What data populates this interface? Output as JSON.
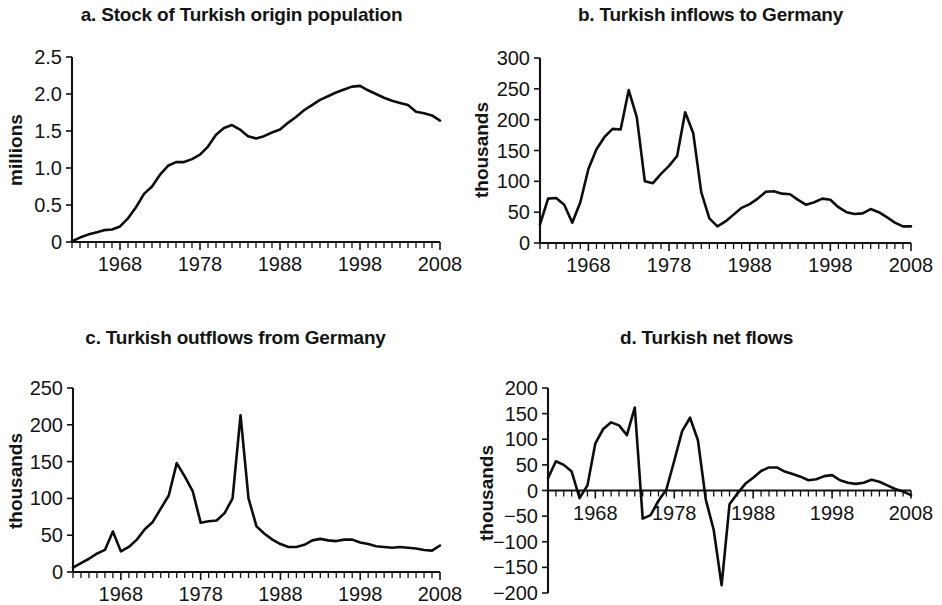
{
  "figure": {
    "background": "#ffffff",
    "line_color": "#0d0d0d",
    "text_color": "#141414"
  },
  "panels": {
    "a": {
      "title": "a. Stock of Turkish origin population"
    },
    "b": {
      "title": "b. Turkish inflows to Germany"
    },
    "c": {
      "title": "c. Turkish outflows from Germany"
    },
    "d": {
      "title": "d. Turkish net flows"
    }
  },
  "chart_data": [
    {
      "id": "a",
      "type": "line",
      "title": "a. Stock of Turkish origin population",
      "xlabel": "",
      "ylabel": "millions",
      "xlim": [
        1962,
        2008
      ],
      "ylim": [
        0,
        2.5
      ],
      "yticks": [
        0,
        0.5,
        1.0,
        1.5,
        2.0,
        2.5
      ],
      "ytick_labels": [
        "0",
        "0.5",
        "1.0",
        "1.5",
        "2.0",
        "2.5"
      ],
      "xticks": [
        1968,
        1978,
        1988,
        1998,
        2008
      ],
      "xtick_labels": [
        "1968",
        "1978",
        "1988",
        "1998",
        "2008"
      ],
      "grid": false,
      "legend": null,
      "x": [
        1962,
        1963,
        1964,
        1965,
        1966,
        1967,
        1968,
        1969,
        1970,
        1971,
        1972,
        1973,
        1974,
        1975,
        1976,
        1977,
        1978,
        1979,
        1980,
        1981,
        1982,
        1983,
        1984,
        1985,
        1986,
        1987,
        1988,
        1989,
        1990,
        1991,
        1992,
        1993,
        1994,
        1995,
        1996,
        1997,
        1998,
        1999,
        2000,
        2001,
        2002,
        2003,
        2004,
        2005,
        2006,
        2007,
        2008
      ],
      "values": [
        0.01,
        0.06,
        0.1,
        0.13,
        0.16,
        0.17,
        0.21,
        0.32,
        0.47,
        0.65,
        0.75,
        0.91,
        1.03,
        1.08,
        1.08,
        1.12,
        1.18,
        1.29,
        1.45,
        1.54,
        1.58,
        1.52,
        1.43,
        1.4,
        1.43,
        1.48,
        1.52,
        1.61,
        1.69,
        1.78,
        1.85,
        1.92,
        1.97,
        2.02,
        2.06,
        2.1,
        2.11,
        2.05,
        2.0,
        1.95,
        1.91,
        1.88,
        1.85,
        1.76,
        1.74,
        1.71,
        1.64
      ]
    },
    {
      "id": "b",
      "type": "line",
      "title": "b. Turkish inflows to Germany",
      "xlabel": "",
      "ylabel": "thousands",
      "xlim": [
        1962,
        2008
      ],
      "ylim": [
        0,
        300
      ],
      "yticks": [
        0,
        50,
        100,
        150,
        200,
        250,
        300
      ],
      "ytick_labels": [
        "0",
        "50",
        "100",
        "150",
        "200",
        "250",
        "300"
      ],
      "xticks": [
        1968,
        1978,
        1988,
        1998,
        2008
      ],
      "xtick_labels": [
        "1968",
        "1978",
        "1988",
        "1998",
        "2008"
      ],
      "grid": false,
      "legend": null,
      "x": [
        1962,
        1963,
        1964,
        1965,
        1966,
        1967,
        1968,
        1969,
        1970,
        1971,
        1972,
        1973,
        1974,
        1975,
        1976,
        1977,
        1978,
        1979,
        1980,
        1981,
        1982,
        1983,
        1984,
        1985,
        1986,
        1987,
        1988,
        1989,
        1990,
        1991,
        1992,
        1993,
        1994,
        1995,
        1996,
        1997,
        1998,
        1999,
        2000,
        2001,
        2002,
        2003,
        2004,
        2005,
        2006,
        2007,
        2008
      ],
      "values": [
        30,
        72,
        73,
        62,
        33,
        66,
        120,
        152,
        172,
        185,
        184,
        248,
        204,
        100,
        97,
        112,
        125,
        141,
        212,
        178,
        82,
        40,
        27,
        35,
        46,
        57,
        63,
        72,
        83,
        84,
        80,
        79,
        70,
        62,
        66,
        72,
        70,
        58,
        50,
        47,
        48,
        55,
        50,
        42,
        33,
        27,
        27
      ]
    },
    {
      "id": "c",
      "type": "line",
      "title": "c. Turkish outflows from Germany",
      "xlabel": "",
      "ylabel": "thousands",
      "xlim": [
        1962,
        2008
      ],
      "ylim": [
        0,
        250
      ],
      "yticks": [
        0,
        50,
        100,
        150,
        200,
        250
      ],
      "ytick_labels": [
        "0",
        "50",
        "100",
        "150",
        "200",
        "250"
      ],
      "xticks": [
        1968,
        1978,
        1988,
        1998,
        2008
      ],
      "xtick_labels": [
        "1968",
        "1978",
        "1988",
        "1998",
        "2008"
      ],
      "grid": false,
      "legend": null,
      "x": [
        1962,
        1963,
        1964,
        1965,
        1966,
        1967,
        1968,
        1969,
        1970,
        1971,
        1972,
        1973,
        1974,
        1975,
        1976,
        1977,
        1978,
        1979,
        1980,
        1981,
        1982,
        1983,
        1984,
        1985,
        1986,
        1987,
        1988,
        1989,
        1990,
        1991,
        1992,
        1993,
        1994,
        1995,
        1996,
        1997,
        1998,
        1999,
        2000,
        2001,
        2002,
        2003,
        2004,
        2005,
        2006,
        2007,
        2008
      ],
      "values": [
        6,
        12,
        18,
        25,
        30,
        55,
        28,
        34,
        44,
        58,
        68,
        86,
        104,
        148,
        130,
        110,
        67,
        69,
        70,
        80,
        100,
        213,
        100,
        62,
        52,
        44,
        38,
        34,
        34,
        37,
        43,
        45,
        43,
        42,
        44,
        44,
        40,
        38,
        35,
        34,
        33,
        34,
        33,
        32,
        30,
        29,
        36
      ]
    },
    {
      "id": "d",
      "type": "line",
      "title": "d. Turkish net flows",
      "xlabel": "",
      "ylabel": "thousands",
      "xlim": [
        1962,
        2008
      ],
      "ylim": [
        -200,
        200
      ],
      "yticks": [
        -200,
        -150,
        -100,
        -50,
        0,
        50,
        100,
        150,
        200
      ],
      "ytick_labels": [
        "−200",
        "−150",
        "−100",
        "−50",
        "0",
        "50",
        "100",
        "150",
        "200"
      ],
      "xticks": [
        1968,
        1978,
        1988,
        1998,
        2008
      ],
      "xtick_labels": [
        "1968",
        "1978",
        "1988",
        "1998",
        "2008"
      ],
      "grid": false,
      "zero_line": true,
      "legend": null,
      "x": [
        1962,
        1963,
        1964,
        1965,
        1966,
        1967,
        1968,
        1969,
        1970,
        1971,
        1972,
        1973,
        1974,
        1975,
        1976,
        1977,
        1978,
        1979,
        1980,
        1981,
        1982,
        1983,
        1984,
        1985,
        1986,
        1987,
        1988,
        1989,
        1990,
        1991,
        1992,
        1993,
        1994,
        1995,
        1996,
        1997,
        1998,
        1999,
        2000,
        2001,
        2002,
        2003,
        2004,
        2005,
        2006,
        2007,
        2008
      ],
      "values": [
        24,
        57,
        50,
        37,
        -15,
        10,
        92,
        120,
        133,
        127,
        108,
        162,
        -55,
        -48,
        -20,
        2,
        58,
        116,
        142,
        98,
        -18,
        -77,
        -185,
        -27,
        -6,
        13,
        25,
        38,
        45,
        45,
        37,
        32,
        27,
        20,
        22,
        28,
        30,
        20,
        15,
        13,
        15,
        21,
        17,
        10,
        3,
        -2,
        -9
      ]
    }
  ]
}
